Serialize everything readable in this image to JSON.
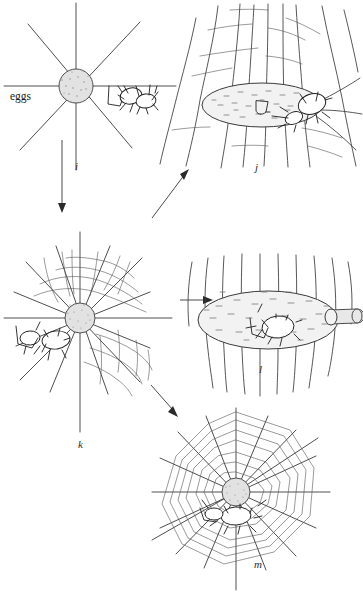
{
  "figure": {
    "width": 363,
    "height": 596,
    "background_color": "#ffffff",
    "ink_color": "#3a3a3a"
  },
  "labels": {
    "eggs": "eggs",
    "panel_i": "i",
    "panel_j": "j",
    "panel_k": "k",
    "panel_l": "l",
    "panel_m": "m"
  },
  "panels": [
    {
      "id": "i",
      "label": "i",
      "label_x": 78,
      "label_y": 165,
      "description": "Radial frame threads meeting at stippled hub with spider and eggs at left",
      "center_x": 76,
      "center_y": 86,
      "hub_radius": 17
    },
    {
      "id": "j",
      "label": "j",
      "label_x": 257,
      "label_y": 166,
      "description": "Oval stippled egg sac suspended among near-vertical silk threads with spider at right",
      "center_x": 275,
      "center_y": 100
    },
    {
      "id": "k",
      "label": "k",
      "label_x": 80,
      "label_y": 443,
      "description": "Partly built orb web with spiral turns, stippled hub, spider and egg sac at left",
      "center_x": 80,
      "center_y": 325,
      "hub_radius": 15
    },
    {
      "id": "l",
      "label": "l",
      "label_x": 261,
      "label_y": 368,
      "description": "Large oval stippled retreat sac with spider inside and tubular opening at right",
      "center_x": 268,
      "center_y": 320
    },
    {
      "id": "m",
      "label": "m",
      "label_x": 256,
      "label_y": 563,
      "description": "Completed orb web with many spiral turns, stippled hub and spider below centre",
      "center_x": 236,
      "center_y": 492,
      "hub_radius": 14
    }
  ],
  "arrows": [
    {
      "name": "arrow-i-to-k",
      "from_panel": "i",
      "to_panel": "k",
      "direction": "down",
      "x1": 62,
      "y1": 140,
      "x2": 62,
      "y2": 212
    },
    {
      "name": "arrow-i-to-j",
      "from_panel": "i",
      "to_panel": "j",
      "direction": "up-right",
      "x1": 152,
      "y1": 218,
      "x2": 189,
      "y2": 170
    },
    {
      "name": "arrow-k-to-l",
      "from_panel": "k",
      "to_panel": "l",
      "direction": "right",
      "x1": 180,
      "y1": 300,
      "x2": 213,
      "y2": 300
    },
    {
      "name": "arrow-k-to-m",
      "from_panel": "k",
      "to_panel": "m",
      "direction": "down-right",
      "x1": 151,
      "y1": 385,
      "x2": 178,
      "y2": 417
    }
  ]
}
